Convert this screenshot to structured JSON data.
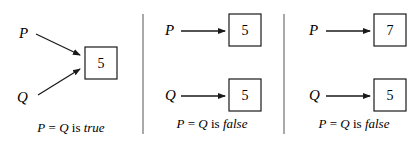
{
  "panels": [
    {
      "id": "shared",
      "var_p": "P",
      "var_q": "Q",
      "box_value": "5",
      "caption": {
        "prefix": "P = Q is ",
        "result": "true"
      }
    },
    {
      "id": "separate-equal",
      "var_p": "P",
      "var_q": "Q",
      "box_p_value": "5",
      "box_q_value": "5",
      "caption": {
        "prefix": "P = Q is ",
        "result": "false"
      }
    },
    {
      "id": "separate-different",
      "var_p": "P",
      "var_q": "Q",
      "box_p_value": "7",
      "box_q_value": "5",
      "caption": {
        "prefix": "P = Q is ",
        "result": "false"
      }
    }
  ],
  "colors": {
    "stroke": "#1a1a1a",
    "divider": "#555555",
    "background": "#ffffff"
  }
}
